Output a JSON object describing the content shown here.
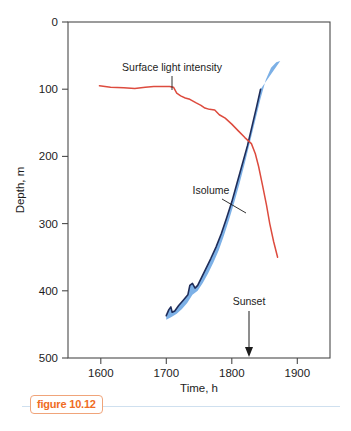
{
  "figure": {
    "caption_label": "figure 10.12"
  },
  "chart_data": {
    "type": "line",
    "title": "",
    "xlabel": "Time, h",
    "ylabel": "Depth, m",
    "xlim": [
      1550,
      1950
    ],
    "ylim": [
      0,
      500
    ],
    "y_inverted": true,
    "grid": false,
    "legend": "none",
    "xticks": [
      1600,
      1700,
      1800,
      1900
    ],
    "xtick_labels": [
      "1600",
      "1700",
      "1800",
      "1900"
    ],
    "yticks": [
      0,
      100,
      200,
      300,
      400,
      500
    ],
    "ytick_labels": [
      "0",
      "100",
      "200",
      "300",
      "400",
      "500"
    ],
    "annotations": [
      {
        "text": "Surface light intensity",
        "x": 1705,
        "y": 50
      },
      {
        "text": "Isolume",
        "x": 1737,
        "y": 245
      },
      {
        "text": "Sunset",
        "x": 1827,
        "y": 415
      }
    ],
    "series": [
      {
        "name": "Surface light intensity",
        "color": "#dd4b3e",
        "points": [
          [
            1598,
            95
          ],
          [
            1615,
            97
          ],
          [
            1635,
            98
          ],
          [
            1652,
            99
          ],
          [
            1668,
            97
          ],
          [
            1681,
            96
          ],
          [
            1694,
            96
          ],
          [
            1705,
            96
          ],
          [
            1711,
            97
          ],
          [
            1716,
            106
          ],
          [
            1722,
            110
          ],
          [
            1729,
            113
          ],
          [
            1736,
            115
          ],
          [
            1745,
            120
          ],
          [
            1753,
            124
          ],
          [
            1759,
            128
          ],
          [
            1766,
            130
          ],
          [
            1774,
            131
          ],
          [
            1781,
            138
          ],
          [
            1790,
            143
          ],
          [
            1800,
            152
          ],
          [
            1810,
            162
          ],
          [
            1820,
            172
          ],
          [
            1830,
            181
          ],
          [
            1836,
            196
          ],
          [
            1841,
            215
          ],
          [
            1847,
            243
          ],
          [
            1853,
            272
          ],
          [
            1858,
            300
          ],
          [
            1864,
            327
          ],
          [
            1870,
            350
          ]
        ]
      },
      {
        "name": "Isolume (band upper/left edge)",
        "color": "#1f2d5a",
        "points": [
          [
            1700,
            437
          ],
          [
            1704,
            428
          ],
          [
            1707,
            424
          ],
          [
            1709,
            432
          ],
          [
            1713,
            430
          ],
          [
            1719,
            422
          ],
          [
            1726,
            414
          ],
          [
            1733,
            406
          ],
          [
            1736,
            392
          ],
          [
            1740,
            389
          ],
          [
            1744,
            396
          ],
          [
            1748,
            392
          ],
          [
            1754,
            380
          ],
          [
            1760,
            368
          ],
          [
            1768,
            352
          ],
          [
            1776,
            335
          ],
          [
            1784,
            315
          ],
          [
            1792,
            292
          ],
          [
            1800,
            268
          ],
          [
            1808,
            240
          ],
          [
            1816,
            212
          ],
          [
            1824,
            184
          ],
          [
            1831,
            155
          ],
          [
            1838,
            126
          ],
          [
            1844,
            100
          ]
        ]
      },
      {
        "name": "Isolume (band lower/right edge)",
        "color": "#6ea7e0",
        "points": [
          [
            1700,
            443
          ],
          [
            1708,
            439
          ],
          [
            1716,
            434
          ],
          [
            1724,
            427
          ],
          [
            1732,
            418
          ],
          [
            1740,
            406
          ],
          [
            1748,
            400
          ],
          [
            1756,
            388
          ],
          [
            1764,
            374
          ],
          [
            1772,
            358
          ],
          [
            1780,
            340
          ],
          [
            1788,
            318
          ],
          [
            1796,
            294
          ],
          [
            1804,
            268
          ],
          [
            1812,
            240
          ],
          [
            1820,
            210
          ],
          [
            1828,
            178
          ],
          [
            1836,
            146
          ],
          [
            1844,
            114
          ],
          [
            1852,
            86
          ],
          [
            1860,
            68
          ],
          [
            1868,
            60
          ],
          [
            1874,
            58
          ]
        ]
      }
    ],
    "band_fill_color": "#7cb0e6",
    "sunset_marker": {
      "x": 1827,
      "label": "Sunset"
    },
    "axis_color": "#4a4a4a"
  }
}
